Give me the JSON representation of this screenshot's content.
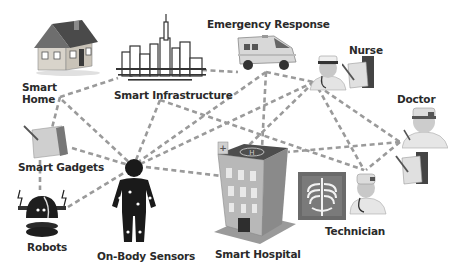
{
  "diagram": {
    "type": "network",
    "line_style": "dashed",
    "line_color": "#9a9a9a",
    "background": "#ffffff",
    "nodes": [
      {
        "id": "smart-home",
        "label_line1": "Smart",
        "label_line2": "Home",
        "icon": "house-icon"
      },
      {
        "id": "smart-infrastructure",
        "label": "Smart Infrastructure",
        "icon": "city-skyline-icon"
      },
      {
        "id": "emergency-response",
        "label": "Emergency Response",
        "icon": "ambulance-icon"
      },
      {
        "id": "nurse",
        "label": "Nurse",
        "icon": "nurse-icon"
      },
      {
        "id": "doctor",
        "label": "Doctor",
        "icon": "doctor-icon"
      },
      {
        "id": "smart-gadgets",
        "label": "Smart Gadgets",
        "icon": "tablet-icon"
      },
      {
        "id": "robots",
        "label": "Robots",
        "icon": "robot-icon"
      },
      {
        "id": "on-body-sensors",
        "label": "On-Body Sensors",
        "icon": "body-sensor-icon"
      },
      {
        "id": "smart-hospital",
        "label": "Smart Hospital",
        "icon": "hospital-building-icon"
      },
      {
        "id": "technician",
        "label": "Technician",
        "icon": "technician-xray-icon"
      }
    ],
    "edges": [
      [
        "smart-home",
        "smart-infrastructure"
      ],
      [
        "smart-home",
        "smart-gadgets"
      ],
      [
        "smart-home",
        "on-body-sensors"
      ],
      [
        "smart-infrastructure",
        "emergency-response"
      ],
      [
        "smart-infrastructure",
        "on-body-sensors"
      ],
      [
        "smart-infrastructure",
        "technician"
      ],
      [
        "emergency-response",
        "nurse"
      ],
      [
        "emergency-response",
        "on-body-sensors"
      ],
      [
        "emergency-response",
        "smart-hospital"
      ],
      [
        "nurse",
        "on-body-sensors"
      ],
      [
        "nurse",
        "smart-hospital"
      ],
      [
        "nurse",
        "doctor"
      ],
      [
        "nurse",
        "technician"
      ],
      [
        "doctor",
        "smart-hospital"
      ],
      [
        "doctor",
        "technician"
      ],
      [
        "smart-gadgets",
        "on-body-sensors"
      ],
      [
        "smart-gadgets",
        "robots"
      ],
      [
        "robots",
        "on-body-sensors"
      ],
      [
        "on-body-sensors",
        "smart-hospital"
      ],
      [
        "smart-hospital",
        "technician"
      ]
    ]
  }
}
